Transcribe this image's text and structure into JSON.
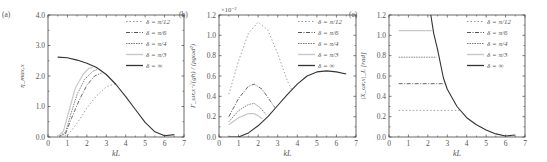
{
  "figure": {
    "panels": [
      "(a)",
      "(b)",
      "(c)"
    ]
  },
  "chart_data": [
    {
      "type": "line",
      "panel_label": "(a)",
      "xlabel": "kL",
      "ylabel": "η_max,x",
      "xlim": [
        0,
        7
      ],
      "ylim": [
        0,
        4
      ],
      "xticks": [
        "0",
        "1",
        "2",
        "3",
        "4",
        "5",
        "6",
        "7"
      ],
      "yticks": [
        "0.0",
        "1.0",
        "2.0",
        "3.0",
        "4.0"
      ],
      "ytick_values": [
        0,
        1,
        2,
        3,
        4
      ],
      "legend_position": "upper right",
      "series": [
        {
          "name": "δ = π/12",
          "style": "dotted-sparse",
          "x": [
            0.5,
            1.0,
            1.5,
            2.0,
            2.5,
            3.0,
            3.5
          ],
          "y": [
            0.0,
            0.05,
            0.45,
            0.95,
            1.35,
            1.65,
            1.75
          ]
        },
        {
          "name": "δ = π/6",
          "style": "dashdot",
          "x": [
            0.5,
            0.9,
            1.2,
            1.6,
            2.0,
            2.4,
            2.75
          ],
          "y": [
            0.0,
            0.1,
            0.6,
            1.2,
            1.7,
            2.0,
            2.1
          ]
        },
        {
          "name": "δ = π/4",
          "style": "dotted-dense",
          "x": [
            0.5,
            0.9,
            1.2,
            1.5,
            1.9,
            2.3,
            2.55
          ],
          "y": [
            0.0,
            0.15,
            0.8,
            1.4,
            1.9,
            2.15,
            2.22
          ]
        },
        {
          "name": "δ = π/3",
          "style": "solid-light",
          "x": [
            0.5,
            0.8,
            1.1,
            1.4,
            1.8,
            2.1,
            2.3
          ],
          "y": [
            0.0,
            0.2,
            0.9,
            1.6,
            2.05,
            2.25,
            2.28
          ]
        },
        {
          "name": "δ = ∞",
          "style": "solid-dark",
          "x": [
            0.5,
            1.0,
            1.5,
            2.0,
            2.5,
            3.0,
            3.5,
            4.0,
            4.5,
            5.0,
            5.5,
            6.0,
            6.5
          ],
          "y": [
            2.62,
            2.6,
            2.52,
            2.42,
            2.28,
            2.05,
            1.72,
            1.32,
            0.9,
            0.48,
            0.17,
            0.04,
            0.08
          ]
        }
      ]
    },
    {
      "type": "line",
      "panel_label": "(b)",
      "xlabel": "kL",
      "ylabel": "Γ_ωr,x·√(gh) / (ρgωd²)",
      "y_multiplier": "×10⁻²",
      "xlim": [
        0,
        7
      ],
      "ylim": [
        0,
        1.2
      ],
      "xticks": [
        "0",
        "1",
        "2",
        "3",
        "4",
        "5",
        "6",
        "7"
      ],
      "yticks": [
        "0.0",
        "0.2",
        "0.4",
        "0.6",
        "0.8",
        "1.0",
        "1.2"
      ],
      "ytick_values": [
        0,
        0.2,
        0.4,
        0.6,
        0.8,
        1.0,
        1.2
      ],
      "legend_position": "upper right",
      "series": [
        {
          "name": "δ = π/12",
          "style": "dotted-sparse",
          "x": [
            0.5,
            1.0,
            1.5,
            2.0,
            2.5,
            3.0,
            3.5,
            3.7
          ],
          "y": [
            0.42,
            0.75,
            1.02,
            1.13,
            1.05,
            0.82,
            0.55,
            0.47
          ]
        },
        {
          "name": "δ = π/6",
          "style": "dashdot",
          "x": [
            0.5,
            1.0,
            1.5,
            1.8,
            2.2,
            2.6,
            2.85
          ],
          "y": [
            0.2,
            0.38,
            0.5,
            0.52,
            0.47,
            0.36,
            0.29
          ]
        },
        {
          "name": "δ = π/4",
          "style": "dotted-dense",
          "x": [
            0.5,
            1.0,
            1.5,
            1.8,
            2.1,
            2.4
          ],
          "y": [
            0.15,
            0.26,
            0.32,
            0.33,
            0.29,
            0.22
          ]
        },
        {
          "name": "δ = π/3",
          "style": "solid-light",
          "x": [
            0.5,
            1.0,
            1.5,
            1.8,
            2.0,
            2.2
          ],
          "y": [
            0.12,
            0.19,
            0.23,
            0.23,
            0.21,
            0.18
          ]
        },
        {
          "name": "δ = ∞",
          "style": "solid-dark",
          "x": [
            0.5,
            1.0,
            1.5,
            2.0,
            2.5,
            3.0,
            3.5,
            4.0,
            4.5,
            5.0,
            5.5,
            6.0,
            6.5
          ],
          "y": [
            0.0,
            0.0,
            0.04,
            0.11,
            0.2,
            0.31,
            0.42,
            0.52,
            0.6,
            0.64,
            0.65,
            0.64,
            0.62
          ]
        }
      ]
    },
    {
      "type": "line",
      "panel_label": "(c)",
      "xlabel": "kL",
      "ylabel": "|X_ωr,x|_L [rad]",
      "xlim": [
        0,
        7
      ],
      "ylim": [
        0,
        1.2
      ],
      "xticks": [
        "0",
        "1",
        "2",
        "3",
        "4",
        "5",
        "6",
        "7"
      ],
      "yticks": [
        "0.0",
        "0.2",
        "0.4",
        "0.6",
        "0.8",
        "1.0",
        "1.2"
      ],
      "ytick_values": [
        0,
        0.2,
        0.4,
        0.6,
        0.8,
        1.0,
        1.2
      ],
      "legend_position": "upper right",
      "series": [
        {
          "name": "δ = π/12",
          "style": "dotted-sparse",
          "x": [
            0.5,
            3.65
          ],
          "y": [
            0.262,
            0.262
          ]
        },
        {
          "name": "δ = π/6",
          "style": "dashdot",
          "x": [
            0.5,
            2.85
          ],
          "y": [
            0.524,
            0.524
          ]
        },
        {
          "name": "δ = π/4",
          "style": "dotted-dense",
          "x": [
            0.5,
            2.45
          ],
          "y": [
            0.785,
            0.785
          ]
        },
        {
          "name": "δ = π/3",
          "style": "solid-light",
          "x": [
            0.5,
            2.2
          ],
          "y": [
            1.047,
            1.047
          ]
        },
        {
          "name": "δ = ∞",
          "style": "solid-dark",
          "x": [
            2.15,
            2.3,
            2.5,
            2.8,
            3.0,
            3.5,
            4.0,
            4.5,
            5.0,
            5.5,
            6.0,
            6.5
          ],
          "y": [
            1.2,
            1.02,
            0.86,
            0.58,
            0.47,
            0.3,
            0.19,
            0.12,
            0.07,
            0.03,
            0.01,
            0.02
          ]
        }
      ]
    }
  ]
}
